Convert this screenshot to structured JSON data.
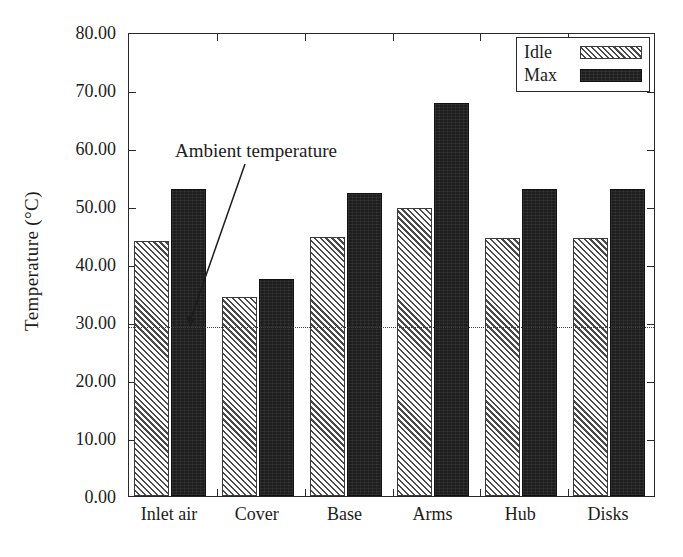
{
  "chart_data": {
    "type": "bar",
    "title": "",
    "xlabel": "",
    "ylabel": "Temperature (°C)",
    "categories": [
      "Inlet air",
      "Cover",
      "Base",
      "Arms",
      "Hub",
      "Disks"
    ],
    "series": [
      {
        "name": "Idle",
        "values": [
          44.0,
          34.3,
          44.7,
          49.6,
          44.5,
          44.4
        ]
      },
      {
        "name": "Max",
        "values": [
          52.9,
          37.5,
          52.3,
          67.8,
          52.9,
          52.9
        ]
      }
    ],
    "ylim": [
      0,
      80
    ],
    "ytick_labels": [
      "0.00",
      "10.00",
      "20.00",
      "30.00",
      "40.00",
      "50.00",
      "60.00",
      "70.00",
      "80.00"
    ],
    "ytick_values": [
      0,
      10,
      20,
      30,
      40,
      50,
      60,
      70,
      80
    ],
    "grid": false,
    "legend": {
      "position": "top-right",
      "entries": [
        "Idle",
        "Max"
      ]
    },
    "annotations": [
      {
        "text": "Ambient temperature",
        "target_value": 29.4,
        "target_category": "Cover"
      }
    ],
    "reference_lines": [
      {
        "label": "Ambient temperature",
        "value": 29.4,
        "style": "dotted"
      }
    ]
  },
  "axis": {
    "y_title": "Temperature (°C)",
    "y_ticks": [
      "80.00",
      "70.00",
      "60.00",
      "50.00",
      "40.00",
      "30.00",
      "20.00",
      "10.00",
      "0.00"
    ],
    "x_ticks": [
      "Inlet air",
      "Cover",
      "Base",
      "Arms",
      "Hub",
      "Disks"
    ]
  },
  "legend": {
    "items": [
      {
        "label": "Idle",
        "swatch": "hatched"
      },
      {
        "label": "Max",
        "swatch": "solid-black"
      }
    ]
  },
  "annotation": {
    "label": "Ambient temperature"
  },
  "colors": {
    "idle_fill": "#ffffff",
    "idle_hatch": "#4a4a4a",
    "max_fill": "#1e1e1e",
    "axis": "#2a2a2a",
    "text": "#1c1c1c",
    "ambient_line": "#3f3f3f"
  }
}
